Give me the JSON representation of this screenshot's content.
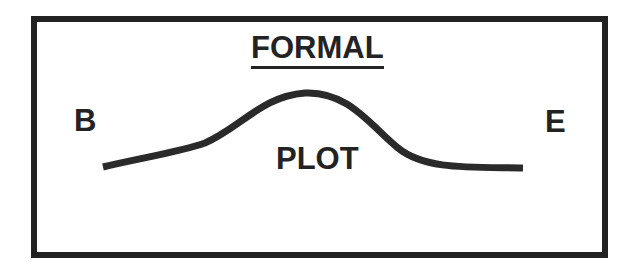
{
  "diagram": {
    "title": "FORMAL",
    "start_label": "B",
    "end_label": "E",
    "curve_label": "PLOT",
    "colors": {
      "ink": "#232323",
      "background": "#ffffff"
    }
  }
}
